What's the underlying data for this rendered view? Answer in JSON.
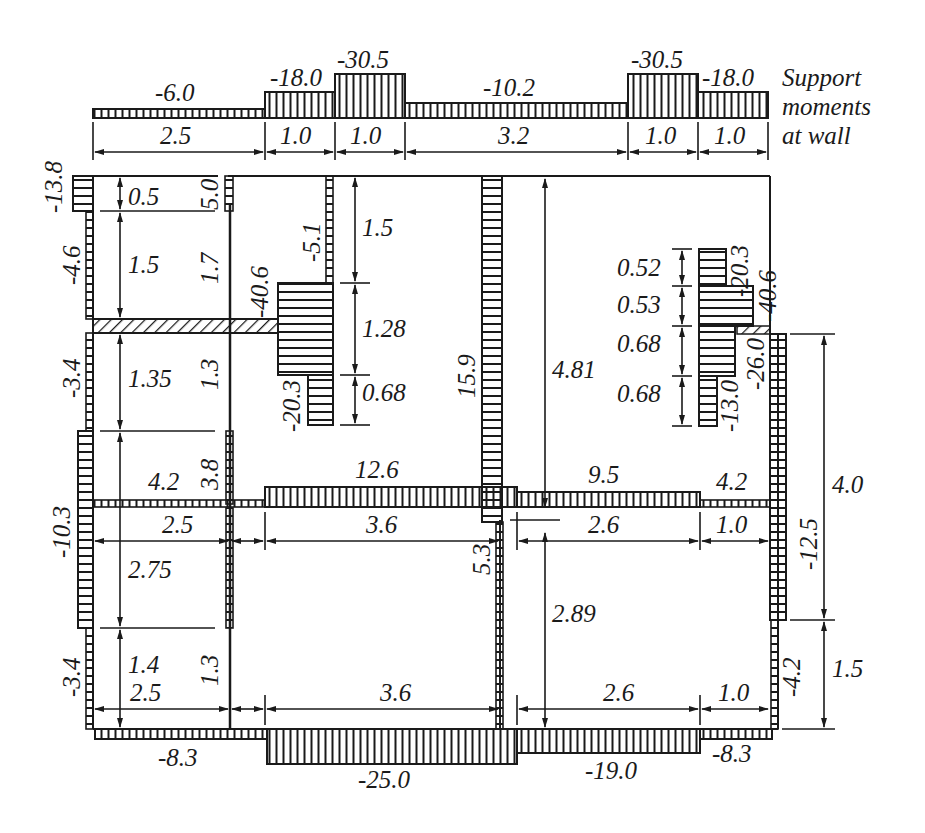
{
  "title_note": [
    "Support",
    "moments",
    "at wall"
  ],
  "top_strip": {
    "moments": [
      {
        "label": "-6.0"
      },
      {
        "label": "-18.0"
      },
      {
        "label": "-30.5"
      },
      {
        "label": "-10.2"
      },
      {
        "label": "-30.5"
      },
      {
        "label": "-18.0"
      }
    ],
    "spans": [
      "2.5",
      "1.0",
      "1.0",
      "3.2",
      "1.0",
      "1.0"
    ]
  },
  "vertical_moments": {
    "left_top_a": "-13.8",
    "left_top_b": "-4.6",
    "left_mid": "-3.4",
    "left_low": "-10.3",
    "left_bottom": "-3.4",
    "inner_wall_top": "5.0",
    "inner_wall_mid": "1.7",
    "inner_wall_low": "1.3",
    "inner_wall_low2": "3.8",
    "inner_wall_bottom": "1.3",
    "col2_top": "-5.1",
    "col2_jump": "-40.6",
    "col2_bottom": "-20.3",
    "center_column": "15.9",
    "center_lower": "5.3",
    "right_inner_top": "-20.3",
    "right_inner_jump": "-40.6",
    "right_inner_low": "-13.0",
    "right_inner_low2": "-26.0",
    "right_wall_upper": "-12.5",
    "right_wall_lower": "-4.2"
  },
  "horizontal_moments": {
    "mid_left": "4.2",
    "mid_center": "12.6",
    "mid_right": "9.5",
    "mid_far_right": "4.2",
    "bottom_left": "-8.3",
    "bottom_center": "-25.0",
    "bottom_right": "-19.0",
    "bottom_far_right": "-8.3"
  },
  "dimensions": {
    "left_vertical": [
      "0.5",
      "1.5",
      "1.35",
      "2.75",
      "1.4"
    ],
    "col2_vertical": [
      "1.5",
      "1.28",
      "0.68"
    ],
    "right_inner_vertical": [
      "0.52",
      "0.53",
      "0.68",
      "0.68"
    ],
    "center_vertical": [
      "4.81",
      "2.89"
    ],
    "right_outer_vertical": [
      "4.0",
      "1.5"
    ],
    "mid_horizontal": [
      "2.5",
      "3.6",
      "2.6",
      "1.0"
    ],
    "bottom_horizontal": [
      "2.5",
      "3.6",
      "2.6",
      "1.0"
    ]
  }
}
